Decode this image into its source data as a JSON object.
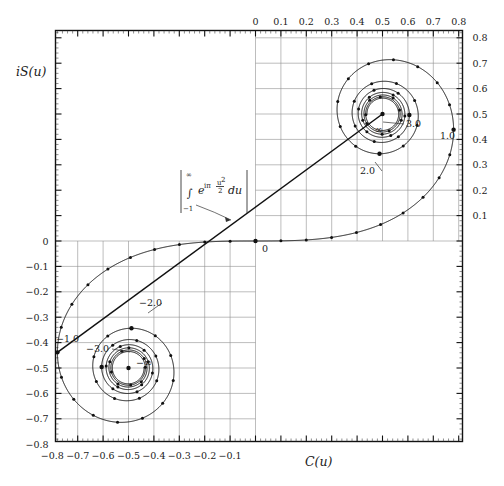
{
  "figure": {
    "type": "cornu-spiral",
    "xlabel": "C(u)",
    "ylabel": "iS(u)",
    "origin_label": "0",
    "annotation": {
      "integrand": "e",
      "exponent": "iπ",
      "frac_num": "u",
      "frac_sup": "2",
      "frac_den": "2",
      "differential": "du",
      "integral_sign": "∫",
      "upper_limit": "∞",
      "lower_limit": "−1"
    },
    "labels": {
      "upper_one": "1.0",
      "upper_two": "2.0",
      "upper_three": "3.0",
      "upper_inf": "∞",
      "lower_one": "−1.0",
      "lower_two": "−2.0",
      "lower_three": "−3.0",
      "lower_inf": "−∞"
    }
  },
  "chart_data": {
    "type": "line",
    "title": "",
    "xlabel": "C(u)",
    "ylabel": "iS(u)",
    "xlim": [
      -0.88,
      0.88
    ],
    "ylim": [
      -0.88,
      0.88
    ],
    "grid": true,
    "grid_quadrants": [
      "upper-right",
      "lower-left"
    ],
    "axis_top_ticks": [
      "0",
      "0.1",
      "0.2",
      "0.3",
      "0.4",
      "0.5",
      "0.6",
      "0.7",
      "0.8"
    ],
    "axis_right_ticks": [
      "0.8",
      "0.7",
      "0.6",
      "0.5",
      "0.4",
      "0.3",
      "0.2",
      "0.1"
    ],
    "axis_left_ticks": [
      "0",
      "-0.1",
      "-0.2",
      "-0.3",
      "-0.4",
      "-0.5",
      "-0.6",
      "-0.7",
      "-0.8"
    ],
    "axis_bottom_ticks": [
      "-0.8",
      "-0.7",
      "-0.6",
      "-0.5",
      "-0.4",
      "-0.3",
      "-0.2",
      "-0.1"
    ],
    "tick_step": 0.1,
    "asymptote_points": [
      {
        "label": "∞",
        "x": 0.5,
        "y": 0.5
      },
      {
        "label": "-∞",
        "x": -0.5,
        "y": -0.5
      }
    ],
    "annotated_points": [
      {
        "label": "0",
        "u": 0.0,
        "x": 0.0,
        "y": 0.0
      },
      {
        "label": "1.0",
        "u": 1.0,
        "x": 0.7799,
        "y": 0.4383
      },
      {
        "label": "2.0",
        "u": 2.0,
        "x": 0.4883,
        "y": 0.3434
      },
      {
        "label": "3.0",
        "u": 3.0,
        "x": 0.6057,
        "y": 0.4963
      },
      {
        "label": "-1.0",
        "u": -1.0,
        "x": -0.7799,
        "y": -0.4383
      },
      {
        "label": "-2.0",
        "u": -2.0,
        "x": -0.4883,
        "y": -0.3434
      },
      {
        "label": "-3.0",
        "u": -3.0,
        "x": -0.6057,
        "y": -0.4963
      }
    ],
    "chord": {
      "from": [
        -0.7799,
        -0.4383
      ],
      "to": [
        0.5,
        0.5
      ]
    },
    "series": [
      {
        "name": "Cornu spiral",
        "description": "Parametric Fresnel integrals C(u)=∫0..u cos(πt²/2)dt, S(u)=∫0..u sin(πt²/2)dt",
        "marker_step_u": 0.1,
        "u_range": [
          -5.2,
          5.2
        ]
      }
    ]
  }
}
